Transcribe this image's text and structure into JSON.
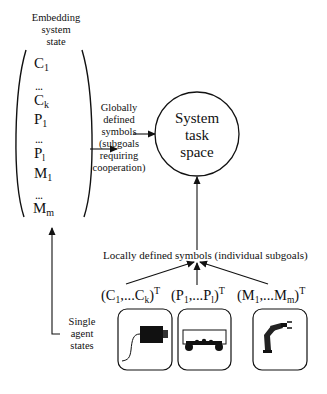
{
  "embedding": {
    "title_lines": [
      "Embedding",
      "system",
      "state"
    ],
    "vector": [
      {
        "base": "C",
        "sub": "1"
      },
      {
        "dots": "..."
      },
      {
        "base": "C",
        "sub": "k"
      },
      {
        "base": "P",
        "sub": "1"
      },
      {
        "dots": "..."
      },
      {
        "base": "P",
        "sub": "l"
      },
      {
        "base": "M",
        "sub": "1"
      },
      {
        "dots": "..."
      },
      {
        "base": "M",
        "sub": "m"
      }
    ]
  },
  "global_symbols": {
    "lines": [
      "Globally",
      "defined",
      "symbols",
      "(subgoals",
      "requiring",
      "cooperation)"
    ]
  },
  "task_space": {
    "lines": [
      "System",
      "task",
      "space"
    ]
  },
  "local_symbols": {
    "label": "Locally defined symbols (individual subgoals)"
  },
  "single_agent": {
    "lines": [
      "Single",
      "agent",
      "states"
    ]
  },
  "agents": [
    {
      "open": "(C",
      "sub1": "1",
      "mid": ",...C",
      "sub2": "k",
      "close": ")",
      "sup": "T",
      "icon": "camera-icon"
    },
    {
      "open": "(P",
      "sub1": "1",
      "mid": ",...P",
      "sub2": "l",
      "close": ")",
      "sup": "T",
      "icon": "mobile-platform-icon"
    },
    {
      "open": "(M",
      "sub1": "1",
      "mid": ",...M",
      "sub2": "m",
      "close": ")",
      "sup": "T",
      "icon": "robot-arm-icon"
    }
  ]
}
